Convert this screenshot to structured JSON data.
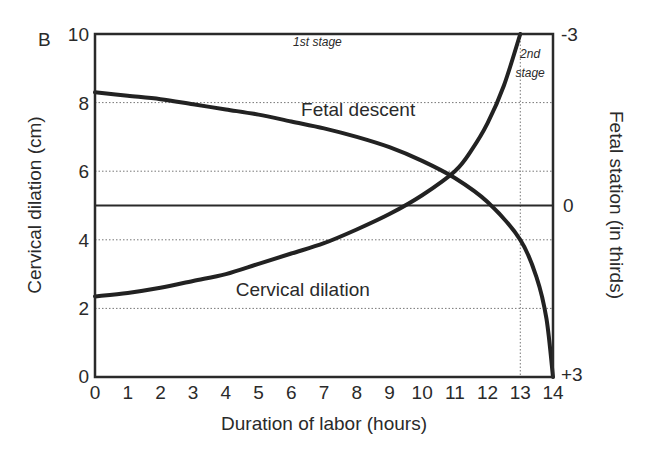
{
  "panel_label": "B",
  "chart_data": {
    "type": "line",
    "title": "",
    "xlabel": "Duration of labor (hours)",
    "ylabel": "Cervical dilation (cm)",
    "ylabel_right": "Fetal station (in thirds)",
    "xlim": [
      0,
      14
    ],
    "ylim": [
      0,
      10
    ],
    "x_ticks": [
      "0",
      "1",
      "2",
      "3",
      "4",
      "5",
      "6",
      "7",
      "8",
      "9",
      "10",
      "11",
      "12",
      "13",
      "14"
    ],
    "y_ticks": [
      "0",
      "2",
      "4",
      "6",
      "8",
      "10"
    ],
    "y_right_ticks": [
      {
        "label": "-3",
        "at": 10
      },
      {
        "label": "0",
        "at": 5
      },
      {
        "label": "+3",
        "at": 0
      }
    ],
    "grid": "dotted horizontal at 2,4,6,8; dotted vertical at 13",
    "reference_line": {
      "y": 5,
      "label": "station 0"
    },
    "stage_divider_x": 13,
    "stage_labels": [
      {
        "text": "1st stage",
        "x": 6.8,
        "y": 9.65
      },
      {
        "text": "2nd",
        "x": 13.3,
        "y": 9.3
      },
      {
        "text": "stage",
        "x": 13.3,
        "y": 8.75
      }
    ],
    "series": [
      {
        "name": "Cervical dilation",
        "label_pos": {
          "x": 4.3,
          "y": 2.35
        },
        "x": [
          0,
          1,
          2,
          3,
          4,
          5,
          6,
          7,
          8,
          9,
          10,
          11,
          11.5,
          12,
          12.5,
          13
        ],
        "values": [
          2.35,
          2.45,
          2.6,
          2.8,
          3.0,
          3.3,
          3.6,
          3.9,
          4.3,
          4.75,
          5.3,
          6.0,
          6.6,
          7.4,
          8.5,
          10.0
        ]
      },
      {
        "name": "Fetal descent",
        "label_pos": {
          "x": 6.3,
          "y": 7.6
        },
        "x": [
          0,
          1,
          2,
          3,
          4,
          5,
          6,
          7,
          8,
          9,
          10,
          11,
          12,
          13,
          13.5,
          13.8,
          14
        ],
        "values": [
          8.3,
          8.2,
          8.1,
          7.95,
          7.8,
          7.65,
          7.45,
          7.25,
          7.0,
          6.7,
          6.3,
          5.8,
          5.1,
          4.0,
          2.9,
          1.7,
          0.0
        ]
      }
    ]
  }
}
